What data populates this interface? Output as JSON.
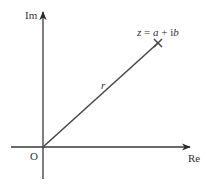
{
  "diagram": {
    "axes": {
      "real_label": "Re",
      "imaginary_label": "Im",
      "origin_label": "O"
    },
    "vector": {
      "modulus_label": "r",
      "point_label_z": "z",
      "point_label_eq": " = ",
      "point_label_a": "a",
      "point_label_plus": " + i",
      "point_label_b": "b",
      "marker": "cross"
    },
    "colors": {
      "axis": "#3a3a3a",
      "ray": "#4a4a4a",
      "text": "#333333"
    }
  }
}
